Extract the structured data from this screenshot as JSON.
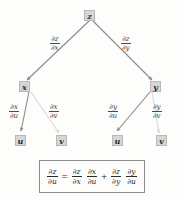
{
  "diagram": {
    "title_text": "",
    "type": "tree-diagram",
    "colors": {
      "node_fill": "#d6d6d6",
      "node_border": "#b8b8b8",
      "edge_dark": "#8a8a8a",
      "edge_light": "#d8d8d8",
      "text": "#2b2b2b",
      "background": "#fdfdfc",
      "box_border": "#8c8c8c"
    },
    "nodes": {
      "root": {
        "label": "z"
      },
      "level2": [
        {
          "label": "x"
        },
        {
          "label": "y"
        }
      ],
      "level3": [
        {
          "label": "u"
        },
        {
          "label": "v"
        },
        {
          "label": "u"
        },
        {
          "label": "v"
        }
      ]
    },
    "edge_labels": {
      "z_to_x": {
        "num": "∂z",
        "den": "∂x"
      },
      "z_to_y": {
        "num": "∂z",
        "den": "∂y"
      },
      "x_to_u": {
        "num": "∂x",
        "den": "∂u"
      },
      "x_to_v": {
        "num": "∂x",
        "den": "∂v"
      },
      "y_to_u": {
        "num": "∂y",
        "den": "∂u"
      },
      "y_to_v": {
        "num": "∂y",
        "den": "∂v"
      }
    },
    "formula": {
      "lhs": {
        "num": "∂z",
        "den": "∂u"
      },
      "equals": "=",
      "term1_a": {
        "num": "∂z",
        "den": "∂x"
      },
      "term1_b": {
        "num": "∂x",
        "den": "∂u"
      },
      "plus": "+",
      "term2_a": {
        "num": "∂z",
        "den": "∂y"
      },
      "term2_b": {
        "num": "∂y",
        "den": "∂u"
      }
    }
  }
}
